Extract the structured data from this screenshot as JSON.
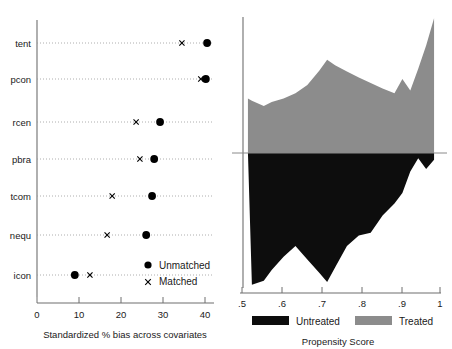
{
  "chart_data": [
    {
      "id": "bias-dotplot",
      "type": "scatter",
      "title": "",
      "xlabel": "Standardized % bias across covariates",
      "ylabel": "",
      "xlim": [
        0,
        43
      ],
      "xticks": [
        0,
        10,
        20,
        30,
        40
      ],
      "xticklabels": [
        "0",
        "10",
        "20",
        "30",
        "40"
      ],
      "grid": true,
      "grid_style": "dotted horizontal",
      "legend_position": "inside lower right",
      "categories": [
        "tent",
        "pcon",
        "rcen",
        "pbra",
        "tcom",
        "nequ",
        "icon"
      ],
      "series": [
        {
          "name": "Unmatched",
          "marker": "filled-circle",
          "values": [
            40.5,
            40.2,
            29.3,
            27.9,
            27.4,
            26.0,
            9.0
          ]
        },
        {
          "name": "Matched",
          "marker": "x",
          "values": [
            34.5,
            39.0,
            23.6,
            24.5,
            17.9,
            16.7,
            12.6
          ]
        }
      ]
    },
    {
      "id": "propensity-overlap",
      "type": "area",
      "title": "",
      "xlabel": "Propensity Score",
      "ylabel": "",
      "xlim": [
        0.5,
        1.0
      ],
      "xticks": [
        0.5,
        0.6,
        0.7,
        0.8,
        0.9,
        1.0
      ],
      "xticklabels": [
        ".5",
        ".6",
        ".7",
        ".8",
        ".9",
        "1"
      ],
      "grid": false,
      "legend_position": "below axis",
      "mirrored": true,
      "x": [
        0.515,
        0.525,
        0.555,
        0.575,
        0.605,
        0.635,
        0.665,
        0.695,
        0.715,
        0.735,
        0.765,
        0.795,
        0.825,
        0.855,
        0.885,
        0.905,
        0.925,
        0.945,
        0.965,
        0.985
      ],
      "series": [
        {
          "name": "Treated",
          "color": "#8c8c8c",
          "direction": "up",
          "values": [
            0.4,
            0.385,
            0.345,
            0.375,
            0.4,
            0.44,
            0.5,
            0.605,
            0.685,
            0.645,
            0.6,
            0.555,
            0.515,
            0.475,
            0.44,
            0.545,
            0.46,
            0.62,
            0.79,
            0.99
          ]
        },
        {
          "name": "Untreated",
          "color": "#0d0d0d",
          "direction": "down",
          "values": [
            0.0,
            0.99,
            0.96,
            0.88,
            0.78,
            0.7,
            0.8,
            0.9,
            0.97,
            0.86,
            0.7,
            0.62,
            0.6,
            0.47,
            0.38,
            0.3,
            0.14,
            0.04,
            0.12,
            0.05
          ]
        }
      ]
    }
  ],
  "left_chart": {
    "xlabel": "Standardized % bias across covariates",
    "xticklabels": [
      "0",
      "10",
      "20",
      "30",
      "40"
    ],
    "categories": [
      "tent",
      "pcon",
      "rcen",
      "pbra",
      "tcom",
      "nequ",
      "icon"
    ],
    "legend": {
      "unmatched": "Unmatched",
      "matched": "Matched"
    }
  },
  "right_chart": {
    "xlabel": "Propensity Score",
    "xticklabels": [
      ".5",
      ".6",
      ".7",
      ".8",
      ".9",
      "1"
    ],
    "legend": {
      "untreated": "Untreated",
      "treated": "Treated"
    }
  },
  "colors": {
    "untreated": "#0d0d0d",
    "treated": "#8c8c8c",
    "axis": "#6e6e6e",
    "marker": "#000000"
  }
}
